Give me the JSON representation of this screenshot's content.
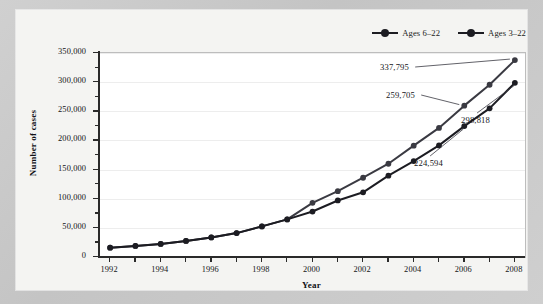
{
  "chart_data": {
    "type": "line",
    "title": "",
    "xlabel": "Year",
    "ylabel": "Number of cases",
    "x": [
      1992,
      1993,
      1994,
      1995,
      1996,
      1997,
      1998,
      1999,
      2000,
      2001,
      2002,
      2003,
      2004,
      2005,
      2006,
      2007,
      2008
    ],
    "xlim": [
      1991.6,
      2008.4
    ],
    "ylim": [
      0,
      350000
    ],
    "y_ticks": [
      0,
      50000,
      100000,
      150000,
      200000,
      250000,
      300000,
      350000
    ],
    "y_tick_labels": [
      "0",
      "50,000",
      "100,000",
      "150,000",
      "200,000",
      "250,000",
      "300,000",
      "350,000"
    ],
    "y_minor_tick_step": 25000,
    "x_tick_labels": [
      "1992",
      "",
      "1994",
      "",
      "1996",
      "",
      "1998",
      "",
      "2000",
      "",
      "2002",
      "",
      "2004",
      "",
      "2006",
      "",
      "2008"
    ],
    "grid": "horizontal-major",
    "legend_position": "top-right",
    "series": [
      {
        "name": "Ages 6-22",
        "values": [
          16000,
          19000,
          22500,
          27500,
          33500,
          41000,
          52500,
          64500,
          78000,
          97000,
          111000,
          139500,
          164500,
          191500,
          224594,
          255000,
          298818
        ]
      },
      {
        "name": "Ages 3-22",
        "values": [
          16000,
          19000,
          22500,
          27500,
          33500,
          41000,
          52500,
          64500,
          93000,
          113000,
          136000,
          160000,
          191000,
          221500,
          259705,
          295500,
          337795
        ]
      }
    ],
    "annotations": [
      {
        "label": "337,795",
        "series": "Ages 3-22",
        "x": 2008,
        "y": 337795
      },
      {
        "label": "259,705",
        "series": "Ages 3-22",
        "x": 2006,
        "y": 259705
      },
      {
        "label": "298,818",
        "series": "Ages 6-22",
        "x": 2008,
        "y": 298818
      },
      {
        "label": "224,594",
        "series": "Ages 6-22",
        "x": 2006,
        "y": 224594
      }
    ]
  },
  "legend": {
    "entries": [
      {
        "label": "Ages 6–22",
        "color": "#1c1c22"
      },
      {
        "label": "Ages 3–22",
        "color": "#1c1c22"
      }
    ]
  },
  "axes": {
    "x_title": "Year",
    "y_title": "Number of cases"
  },
  "colors": {
    "series_1": "#1c1c22",
    "series_2": "#3a3a42",
    "grid": "#ededed",
    "axis": "#2a2a2a",
    "plot_background": "#ffffff",
    "card_background": "#f4f4f2",
    "page_background": "#c9c9c9"
  }
}
